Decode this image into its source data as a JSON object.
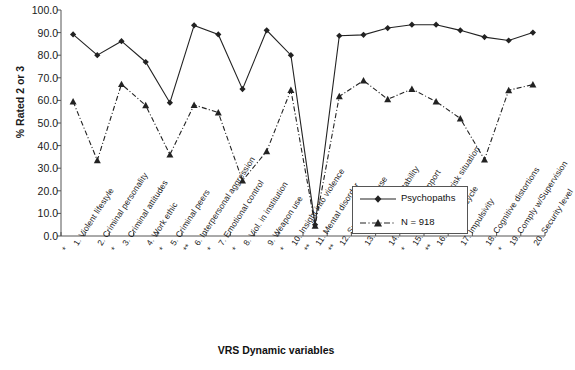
{
  "chart_data": {
    "type": "line",
    "title": "",
    "xlabel": "VRS Dynamic variables",
    "ylabel": "% Rated 2 or 3",
    "ylim": [
      0,
      100
    ],
    "yticks": [
      "0.0",
      "10.0",
      "20.0",
      "30.0",
      "40.0",
      "50.0",
      "60.0",
      "70.0",
      "80.0",
      "90.0",
      "100.0"
    ],
    "grid": false,
    "legend_position": "inside-lower-right",
    "categories": [
      "1. Violent lifestyle",
      "2. Criminal personality",
      "3. Criminal attitudes",
      "4. Work ethic",
      "5. Criminal peers",
      "6. Interpersonal aggression",
      "7. Emotional control",
      "8. Viol. in institution",
      "9. Weapon use",
      "10. Insight into violence",
      "11. Mental disorder",
      "12. Substance abuse",
      "13. Relationship stability",
      "14. Community support",
      "15. Release to Hi risk situation",
      "16. Violence cycle",
      "17. Impulsivity",
      "18. Cognitive distortions",
      "19. Comply w/Supervision",
      "20. Security level"
    ],
    "significance_marks": [
      "*",
      "",
      "*",
      "",
      "*",
      "**",
      "*",
      "*",
      "",
      "*",
      "**",
      "**",
      "",
      "",
      "*",
      "**",
      "",
      "",
      "*",
      ""
    ],
    "series": [
      {
        "name": "Psychopaths",
        "marker": "diamond",
        "line_style": "solid",
        "color": "#222222",
        "values": [
          89.2,
          80.0,
          86.2,
          77.0,
          59.0,
          93.2,
          89.2,
          65.0,
          91.0,
          80.0,
          5.0,
          88.6,
          89.0,
          92.0,
          93.5,
          93.5,
          91.0,
          88.0,
          86.5,
          90.0
        ]
      },
      {
        "name": "N = 918",
        "marker": "triangle",
        "line_style": "dash-dot",
        "color": "#222222",
        "values": [
          59.5,
          33.5,
          67.2,
          57.8,
          36.0,
          58.0,
          54.6,
          24.5,
          37.5,
          64.6,
          4.5,
          61.8,
          68.8,
          60.5,
          65.0,
          59.5,
          52.0,
          33.8,
          64.5,
          67.0
        ]
      }
    ]
  },
  "legend": {
    "entries": [
      {
        "label": "Psychopaths"
      },
      {
        "label": "N = 918"
      }
    ]
  }
}
